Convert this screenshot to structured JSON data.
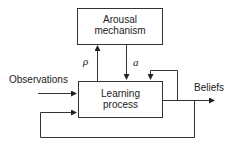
{
  "diagram": {
    "nodes": {
      "arousal": {
        "line1": "Arousal",
        "line2": "mechanism"
      },
      "learning": {
        "line1": "Learning",
        "line2": "process"
      }
    },
    "edges": {
      "rho_label": "ρ",
      "a_label": "a"
    },
    "inputs": {
      "observations": "Observations"
    },
    "outputs": {
      "beliefs": "Beliefs"
    },
    "colors": {
      "stroke": "#333333",
      "text": "#222222",
      "background": "#ffffff"
    }
  }
}
